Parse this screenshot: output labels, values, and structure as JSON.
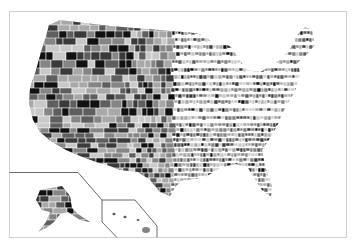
{
  "map": {
    "type": "choropleth",
    "subject": "United States counties",
    "color_scheme": "grayscale",
    "palette": [
      "#111111",
      "#3a3a3a",
      "#5e5e5e",
      "#858585",
      "#a8a8a8",
      "#c9c9c9"
    ],
    "border_color": "#ffffff",
    "frame_color": "#d0d0d0",
    "inset_line_color": "#444444",
    "insets": [
      {
        "name": "Alaska"
      },
      {
        "name": "Hawaii"
      }
    ],
    "text_labels": []
  }
}
